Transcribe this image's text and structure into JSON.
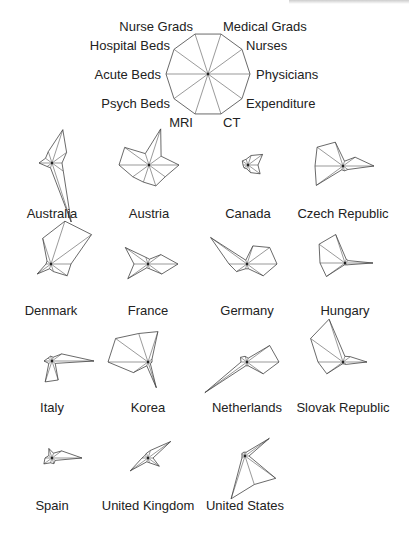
{
  "chart_data": {
    "type": "star",
    "title": "",
    "axes": [
      "Physicians",
      "Nurses",
      "Medical Grads",
      "Nurse Grads",
      "Hospital Beds",
      "Acute Beds",
      "Psych Beds",
      "MRI",
      "CT",
      "Expenditure"
    ],
    "axis_angles_deg": [
      0,
      36,
      72,
      108,
      144,
      180,
      216,
      252,
      288,
      324
    ],
    "key": {
      "cx": 208,
      "cy": 74,
      "r": 42
    },
    "scale_px": 50,
    "layout": {
      "columns": 4,
      "rows": 4,
      "grid": false,
      "legend_position": "top-center"
    },
    "series": [
      {
        "name": "Australia",
        "cx": 52,
        "cy": 163,
        "label_y": 218,
        "values": [
          0.2,
          0.36,
          0.7,
          0.24,
          0.16,
          0.26,
          0.12,
          0.1,
          1.24,
          0.28
        ]
      },
      {
        "name": "Austria",
        "cx": 149,
        "cy": 165,
        "label_y": 218,
        "values": [
          0.6,
          0.3,
          0.76,
          0.24,
          0.6,
          0.6,
          0.4,
          0.36,
          0.44,
          0.4
        ]
      },
      {
        "name": "Canada",
        "cx": 248,
        "cy": 165,
        "label_y": 218,
        "values": [
          0.2,
          0.36,
          0.2,
          0.12,
          0.14,
          0.1,
          0.1,
          0.08,
          0.16,
          0.3
        ]
      },
      {
        "name": "Czech Republic",
        "cx": 343,
        "cy": 166,
        "label_y": 218,
        "values": [
          0.62,
          0.3,
          0.1,
          0.5,
          0.64,
          0.56,
          0.66,
          0.08,
          0.1,
          0.12
        ]
      },
      {
        "name": "Denmark",
        "cx": 51,
        "cy": 264,
        "label_y": 315,
        "values": [
          0.4,
          1.0,
          0.9,
          0.54,
          0.1,
          0.1,
          0.34,
          0.1,
          0.16,
          0.4
        ]
      },
      {
        "name": "France",
        "cx": 148,
        "cy": 264,
        "label_y": 315,
        "values": [
          0.6,
          0.32,
          0.1,
          0.14,
          0.56,
          0.28,
          0.5,
          0.08,
          0.1,
          0.34
        ]
      },
      {
        "name": "Germany",
        "cx": 247,
        "cy": 264,
        "label_y": 315,
        "values": [
          0.6,
          0.56,
          0.38,
          0.08,
          0.9,
          0.36,
          0.26,
          0.1,
          0.1,
          0.4
        ]
      },
      {
        "name": "Hungary",
        "cx": 345,
        "cy": 263,
        "label_y": 315,
        "values": [
          0.56,
          0.08,
          0.08,
          0.6,
          0.64,
          0.5,
          0.46,
          0.04,
          0.04,
          0.06
        ]
      },
      {
        "name": "Italy",
        "cx": 52,
        "cy": 361,
        "label_y": 412,
        "values": [
          0.84,
          0.24,
          0.08,
          0.1,
          0.1,
          0.16,
          0.08,
          0.44,
          0.4,
          0.08
        ]
      },
      {
        "name": "Korea",
        "cx": 148,
        "cy": 362,
        "label_y": 412,
        "values": [
          0.08,
          0.1,
          0.64,
          0.6,
          0.8,
          0.8,
          0.36,
          0.08,
          0.54,
          0.06
        ]
      },
      {
        "name": "Netherlands",
        "cx": 247,
        "cy": 362,
        "label_y": 412,
        "values": [
          0.64,
          0.56,
          0.08,
          0.12,
          0.16,
          0.12,
          1.04,
          0.08,
          0.08,
          0.4
        ]
      },
      {
        "name": "Slovak Republic",
        "cx": 343,
        "cy": 362,
        "label_y": 412,
        "values": [
          0.48,
          0.18,
          0.12,
          0.9,
          0.8,
          0.5,
          0.4,
          0.04,
          0.04,
          0.08
        ]
      },
      {
        "name": "Spain",
        "cx": 52,
        "cy": 458,
        "label_y": 510,
        "values": [
          0.6,
          0.24,
          0.1,
          0.2,
          0.08,
          0.14,
          0.2,
          0.1,
          0.12,
          0.08
        ]
      },
      {
        "name": "United Kingdom",
        "cx": 148,
        "cy": 458,
        "label_y": 510,
        "values": [
          0.1,
          0.56,
          0.16,
          0.1,
          0.08,
          0.12,
          0.44,
          0.08,
          0.1,
          0.28
        ]
      },
      {
        "name": "United States",
        "cx": 245,
        "cy": 456,
        "label_y": 510,
        "values": [
          0.08,
          0.6,
          0.08,
          0.08,
          0.08,
          0.06,
          0.08,
          0.9,
          0.6,
          0.76
        ]
      }
    ]
  },
  "key_labels": {
    "Physicians": {
      "x": 256,
      "y": 79,
      "anchor": "start"
    },
    "Nurses": {
      "x": 246,
      "y": 50,
      "anchor": "start"
    },
    "Medical Grads": {
      "x": 223,
      "y": 31,
      "anchor": "start"
    },
    "Nurse Grads": {
      "x": 193,
      "y": 31,
      "anchor": "end"
    },
    "Hospital Beds": {
      "x": 170,
      "y": 50,
      "anchor": "end"
    },
    "Acute Beds": {
      "x": 161,
      "y": 79,
      "anchor": "end"
    },
    "Psych Beds": {
      "x": 170,
      "y": 108,
      "anchor": "end"
    },
    "MRI": {
      "x": 193,
      "y": 127,
      "anchor": "end"
    },
    "CT": {
      "x": 223,
      "y": 127,
      "anchor": "start"
    },
    "Expenditure": {
      "x": 246,
      "y": 108,
      "anchor": "start"
    }
  }
}
